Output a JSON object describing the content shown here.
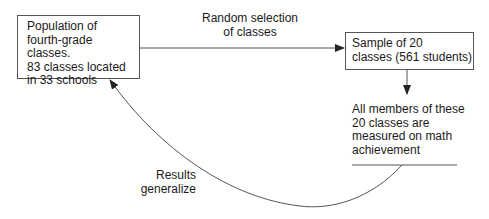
{
  "diagram": {
    "population_box": {
      "text": "Population of\nfourth-grade classes.\n83 classes located\nin 33 schools"
    },
    "selection_arrow": {
      "label": "Random selection\nof classes"
    },
    "sample_box": {
      "text": "Sample of 20\nclasses (561 students)"
    },
    "measurement_note": {
      "text": "All members of these\n20 classes are\nmeasured on math\nachievement"
    },
    "generalize_arrow": {
      "label": "Results\ngeneralize"
    },
    "colors": {
      "line": "#555555",
      "text": "#1a1a1a",
      "background": "#ffffff"
    }
  }
}
